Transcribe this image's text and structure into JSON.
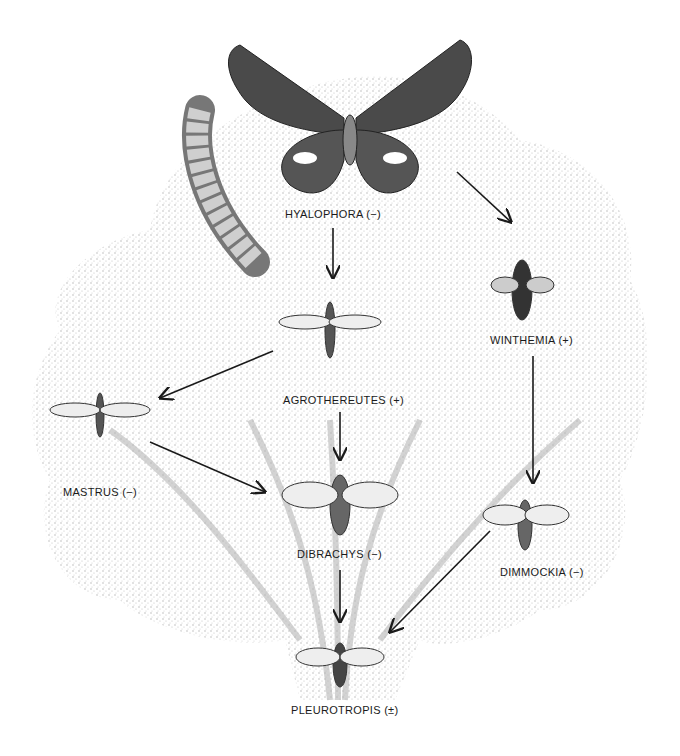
{
  "diagram": {
    "type": "food-web illustration",
    "colors": {
      "ink": "#1a1a1a",
      "stipple": "#9a9a9a",
      "background": "#ffffff"
    },
    "nodes": [
      {
        "id": "hyalophora",
        "label": "HYALOPHORA (−)",
        "organism": "moth (host)"
      },
      {
        "id": "agrothereutes",
        "label": "AGROTHEREUTES (+)",
        "organism": "wasp"
      },
      {
        "id": "winthemia",
        "label": "WINTHEMIA (+)",
        "organism": "fly"
      },
      {
        "id": "mastrus",
        "label": "MASTRUS (−)",
        "organism": "wasp"
      },
      {
        "id": "dibrachys",
        "label": "DIBRACHYS (−)",
        "organism": "wasp"
      },
      {
        "id": "dimmockia",
        "label": "DIMMOCKIA (−)",
        "organism": "wasp"
      },
      {
        "id": "pleurotropis",
        "label": "PLEUROTROPIS (±)",
        "organism": "wasp"
      }
    ],
    "edges": [
      {
        "from": "hyalophora",
        "to": "agrothereutes"
      },
      {
        "from": "hyalophora",
        "to": "winthemia"
      },
      {
        "from": "agrothereutes",
        "to": "mastrus"
      },
      {
        "from": "agrothereutes",
        "to": "dibrachys"
      },
      {
        "from": "mastrus",
        "to": "dibrachys"
      },
      {
        "from": "winthemia",
        "to": "dimmockia"
      },
      {
        "from": "dibrachys",
        "to": "pleurotropis"
      },
      {
        "from": "dimmockia",
        "to": "pleurotropis"
      }
    ]
  }
}
